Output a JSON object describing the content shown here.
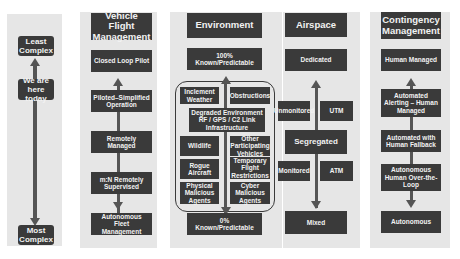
{
  "complexity_scale": {
    "top_label": "Least\nComplex",
    "current_label": "We are\nhere today",
    "bottom_label": "Most\nComplex"
  },
  "columns": [
    {
      "header": "Vehicle Flight\nManagement",
      "items": [
        "Closed Loop Pilot",
        "Piloted–Simplified\nOperation",
        "Remotely\nManaged",
        "m:N Remotely\nSupervised",
        "Autonomous Fleet\nManagement"
      ]
    },
    {
      "header": "Environment",
      "top": "100%\nKnown/Predictable",
      "grid": [
        "Inclement\nWeather",
        "Obstructions",
        "Degraded Environment\nRF / GPS / C2 Link\nInfrastructure",
        "Wildlife",
        "Other\nParticipating\nVehicles",
        "Rogue\nAircraft",
        "Temporary\nFlight\nRestrictions",
        "Physical\nMalicious\nAgents",
        "Cyber\nMalicious\nAgents"
      ],
      "bottom": "0%\nKnown/Predictable"
    },
    {
      "header": "Airspace",
      "items": [
        "Dedicated",
        "Unmonitored",
        "UTM",
        "Segregated",
        "Monitored",
        "ATM",
        "Mixed"
      ]
    },
    {
      "header": "Contingency\nManagement",
      "items": [
        "Human Managed",
        "Automated\nAlerting – Human\nManaged",
        "Automated with\nHuman Fallback",
        "Autonomous\nHuman Over-the-\nLoop",
        "Autonomous"
      ]
    }
  ]
}
